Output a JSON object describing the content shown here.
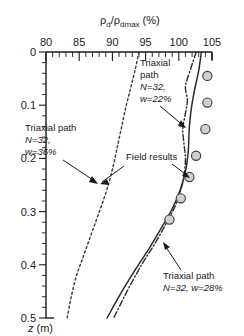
{
  "chart_data": {
    "type": "line",
    "title_parts": {
      "rho1": "ρ",
      "sub1": "d",
      "slash": "/",
      "rho2": "ρ",
      "sub2": "dmax",
      "unit": "(%)"
    },
    "xlabel": "ρd/ρdmax (%)",
    "ylabel": "z (m)",
    "ylabel_parts": {
      "symbol": "z",
      "unit": "(m)"
    },
    "xlim": [
      80,
      105
    ],
    "ylim": [
      0,
      0.5
    ],
    "x_ticks": [
      80,
      85,
      90,
      95,
      100,
      105
    ],
    "x_tick_labels": [
      "80",
      "85",
      "90",
      "95",
      "100",
      "105"
    ],
    "x_minor_step": 1,
    "y_ticks": [
      0,
      0.1,
      0.2,
      0.3,
      0.4,
      0.5
    ],
    "y_tick_labels": [
      "0",
      "0.1",
      "0.2",
      "0.3",
      "0.4",
      "0.5"
    ],
    "y_minor_step": 0.02,
    "grid": false,
    "legend": "none",
    "axis_position": {
      "x_axis": "top",
      "y_axis": "left",
      "y_direction": "down"
    },
    "series": [
      {
        "name": "Triaxial path N=32, w=36%",
        "style": "dashed",
        "x": [
          94.0,
          93.4,
          92.7,
          92.0,
          91.4,
          90.8,
          90.2,
          89.5,
          88.6,
          87.6,
          86.6,
          85.6,
          84.6,
          83.8,
          83.2
        ],
        "y": [
          0.0,
          0.035,
          0.07,
          0.105,
          0.14,
          0.175,
          0.21,
          0.245,
          0.28,
          0.315,
          0.35,
          0.385,
          0.42,
          0.46,
          0.5
        ]
      },
      {
        "name": "Triaxial path N=32, w=28%",
        "style": "solid",
        "x": [
          103.4,
          103.0,
          102.4,
          101.9,
          101.6,
          101.5,
          101.4,
          101.0,
          100.2,
          99.0,
          97.4,
          95.5,
          93.4,
          91.2,
          89.2
        ],
        "y": [
          0.0,
          0.035,
          0.07,
          0.105,
          0.14,
          0.165,
          0.19,
          0.225,
          0.26,
          0.295,
          0.33,
          0.37,
          0.41,
          0.455,
          0.5
        ]
      },
      {
        "name": "Triaxial path N=32, w=22%",
        "style": "dash-dot",
        "x": [
          102.6,
          101.7,
          101.0,
          101.3,
          101.0,
          100.6,
          100.8,
          101.0,
          100.6,
          99.6,
          98.2,
          96.4,
          94.4,
          92.2,
          90.2
        ],
        "y": [
          0.0,
          0.035,
          0.065,
          0.09,
          0.115,
          0.145,
          0.175,
          0.205,
          0.245,
          0.285,
          0.32,
          0.36,
          0.4,
          0.45,
          0.5
        ]
      }
    ],
    "field_results": {
      "name": "Field results",
      "marker": "open-gray-circle",
      "x": [
        104.3,
        104.3,
        104.0,
        102.6,
        101.6,
        100.3,
        98.6
      ],
      "y": [
        0.045,
        0.095,
        0.145,
        0.195,
        0.235,
        0.275,
        0.315
      ]
    },
    "annotations": [
      {
        "id": "triaxial-22",
        "lines": [
          "Triaxial",
          "path",
          "N=32,",
          "w=22%"
        ],
        "text": "Triaxial path N=32, w=22%",
        "x_px": 140,
        "y_px": 66,
        "arrow": {
          "from_x": 176,
          "from_y": 112,
          "to_x": 187,
          "to_y": 129
        }
      },
      {
        "id": "triaxial-36",
        "lines": [
          "Triaxial path",
          "N=32,",
          "w=36%"
        ],
        "text": "Triaxial path N=32, w=36%",
        "x_px": 25,
        "y_px": 127,
        "arrow": {
          "from_x": 64,
          "from_y": 160,
          "to_x": 97,
          "to_y": 183
        }
      },
      {
        "id": "field-results",
        "lines": [
          "Field results"
        ],
        "text": "Field results",
        "x_px": 126,
        "y_px": 156,
        "arrow_left": {
          "from_x": 124,
          "from_y": 162,
          "to_x": 100,
          "to_y": 182
        },
        "arrow_right": {
          "from_x": 172,
          "from_y": 162,
          "to_x": 190,
          "to_y": 177
        }
      },
      {
        "id": "triaxial-28",
        "lines": [
          "Triaxial path",
          "N=32, w=28%"
        ],
        "text": "Triaxial path N=32, w=28%",
        "x_px": 163,
        "y_px": 275,
        "arrow": {
          "from_x": 182,
          "from_y": 268,
          "to_x": 163,
          "to_y": 242
        }
      }
    ],
    "colors": {
      "axis": "#1a1a1a",
      "curve": "#2b2b2b",
      "marker_fill": "#cfcfcf",
      "marker_stroke": "#3a3a3a",
      "background": "#ffffff"
    }
  }
}
